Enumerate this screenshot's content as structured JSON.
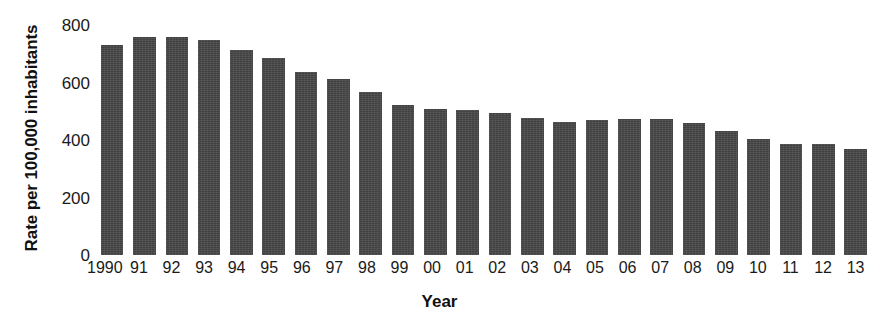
{
  "chart_data": {
    "type": "bar",
    "title": "",
    "xlabel": "Year",
    "ylabel": "Rate per 100,000 inhabitants",
    "categories": [
      "1990",
      "91",
      "92",
      "93",
      "94",
      "95",
      "96",
      "97",
      "98",
      "99",
      "00",
      "01",
      "02",
      "03",
      "04",
      "05",
      "06",
      "07",
      "08",
      "09",
      "10",
      "11",
      "12",
      "13"
    ],
    "values": [
      732,
      758,
      757,
      747,
      714,
      685,
      637,
      611,
      568,
      523,
      507,
      505,
      494,
      475,
      463,
      469,
      474,
      472,
      458,
      432,
      405,
      387,
      387,
      368
    ],
    "ylim": [
      0,
      800
    ],
    "y_ticks": [
      800,
      600,
      400,
      200,
      0
    ],
    "y_tick_labels": [
      "800",
      "600",
      "400",
      "200",
      "0"
    ],
    "grid": false,
    "legend": null,
    "bar_color": "#474747",
    "background_color": "#ffffff"
  }
}
